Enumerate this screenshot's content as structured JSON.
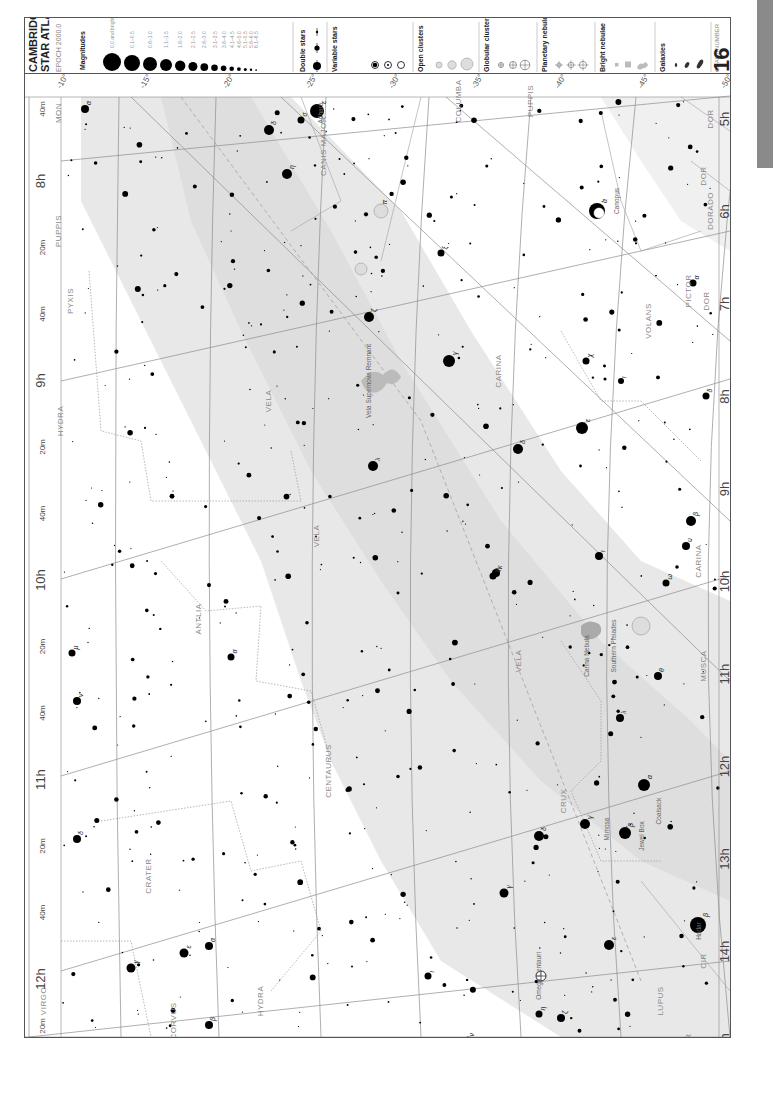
{
  "legend": {
    "title_line1": "CAMBRIDGE",
    "title_line2": "STAR ATLAS",
    "epoch": "EPOCH 2000.0",
    "magnitudes_label": "Magnitudes",
    "magnitudes": [
      {
        "label": "0.0 and brighter",
        "r": 9
      },
      {
        "label": "0.1–0.5",
        "r": 8
      },
      {
        "label": "0.6–1.0",
        "r": 7
      },
      {
        "label": "1.1–1.5",
        "r": 6
      },
      {
        "label": "1.6–2.0",
        "r": 5.2
      },
      {
        "label": "2.1–2.5",
        "r": 4.5
      },
      {
        "label": "2.6–3.0",
        "r": 3.9
      },
      {
        "label": "3.1–3.5",
        "r": 3.3
      },
      {
        "label": "3.6–4.0",
        "r": 2.8
      },
      {
        "label": "4.1–4.5",
        "r": 2.3
      },
      {
        "label": "4.6–5.0",
        "r": 1.9
      },
      {
        "label": "5.1–5.5",
        "r": 1.5
      },
      {
        "label": "5.6–6.0",
        "r": 1.2
      },
      {
        "label": "6.1–6.5",
        "r": 0.9
      }
    ],
    "double_stars_label": "Double stars",
    "variable_stars_label": "Variable stars",
    "variable_stars_sub": "max – min",
    "variable_stars": [
      "3.0–4.2",
      "3.0–5.5",
      "3.0–>6.5"
    ],
    "open_clusters_label": "Open clusters",
    "open_clusters": [
      "<10'",
      ">10'",
      "drawn to scale"
    ],
    "globular_clusters_label": "Globular clusters",
    "globular_clusters": [
      "<10'",
      "10'–30'",
      ">30'"
    ],
    "planetary_nebulae_label": "Planetary nebulae",
    "planetary_nebulae": [
      "<1'",
      "1'–10'",
      ">10'"
    ],
    "bright_nebulae_label": "Bright nebulae",
    "bright_nebulae": [
      "<10'",
      "10'–30'",
      ">30' drawn to scale"
    ],
    "galaxies_label": "Galaxies",
    "galaxies": [
      "<10'",
      "10'–30'",
      ">30' drawn to scale"
    ],
    "chart_number_label": "CHART NUMBER",
    "chart_number": "16"
  },
  "chart": {
    "ra_left": [
      "8h",
      "20m",
      "40m",
      "9h",
      "20m",
      "40m",
      "10h",
      "20m",
      "40m",
      "11h",
      "20m",
      "40m",
      "12h"
    ],
    "ra_left_top": "40m",
    "ra_left_bottom": "20m",
    "ra_right": [
      "5h",
      "6h",
      "7h",
      "8h",
      "9h",
      "10h",
      "11h",
      "12h",
      "13h",
      "14h",
      "15h"
    ],
    "dec_top": [
      "-10°",
      "-15°",
      "-20°",
      "-25°",
      "-30°",
      "-35°",
      "-40°",
      "-45°",
      "-50°"
    ],
    "dec_bottom": [
      "-10°",
      "-15°",
      "-20°",
      "-25°",
      "-30°",
      "-35°",
      "-40°",
      "-45°",
      "-50°"
    ],
    "dec_right": [
      "-60°",
      "-70°",
      "-70°",
      "-60°"
    ],
    "constellations": [
      {
        "name": "MON",
        "x": 60,
        "y": 112
      },
      {
        "name": "PUPPIS",
        "x": 60,
        "y": 230
      },
      {
        "name": "PYXIS",
        "x": 72,
        "y": 300
      },
      {
        "name": "HYDRA",
        "x": 62,
        "y": 420
      },
      {
        "name": "ANTLIA",
        "x": 200,
        "y": 618
      },
      {
        "name": "CANIS MAJOR",
        "x": 325,
        "y": 145
      },
      {
        "name": "COLUMBA",
        "x": 460,
        "y": 100
      },
      {
        "name": "PUPPIS",
        "x": 532,
        "y": 100
      },
      {
        "name": "VELA",
        "x": 270,
        "y": 400
      },
      {
        "name": "VELA",
        "x": 318,
        "y": 535
      },
      {
        "name": "VELA",
        "x": 520,
        "y": 660
      },
      {
        "name": "CARINA",
        "x": 500,
        "y": 370
      },
      {
        "name": "CARINA",
        "x": 700,
        "y": 560
      },
      {
        "name": "VOLANS",
        "x": 650,
        "y": 320
      },
      {
        "name": "PICTOR",
        "x": 690,
        "y": 290
      },
      {
        "name": "DORADO",
        "x": 712,
        "y": 210
      },
      {
        "name": "DOR",
        "x": 712,
        "y": 118
      },
      {
        "name": "DOR",
        "x": 705,
        "y": 175
      },
      {
        "name": "DOR",
        "x": 708,
        "y": 300
      },
      {
        "name": "MUSCA",
        "x": 705,
        "y": 665
      },
      {
        "name": "CRUX",
        "x": 565,
        "y": 800
      },
      {
        "name": "CENTAURUS",
        "x": 330,
        "y": 770
      },
      {
        "name": "CRATER",
        "x": 150,
        "y": 875
      },
      {
        "name": "CORVUS",
        "x": 175,
        "y": 1020
      },
      {
        "name": "HYDRA",
        "x": 262,
        "y": 1000
      },
      {
        "name": "VIRGO",
        "x": 45,
        "y": 1000
      },
      {
        "name": "LUPUS",
        "x": 662,
        "y": 1000
      },
      {
        "name": "CIR",
        "x": 705,
        "y": 960
      },
      {
        "name": "CIR",
        "x": 690,
        "y": 1040
      }
    ],
    "named_objects": [
      {
        "name": "Adhara",
        "x": 322,
        "y": 112
      },
      {
        "name": "Canopus",
        "x": 618,
        "y": 200
      },
      {
        "name": "Vela Supernova Remnant",
        "x": 370,
        "y": 380
      },
      {
        "name": "Southern Pleiades",
        "x": 615,
        "y": 645
      },
      {
        "name": "Carina Nebula",
        "x": 588,
        "y": 655
      },
      {
        "name": "Mimosa",
        "x": 608,
        "y": 828
      },
      {
        "name": "Jewel Box",
        "x": 643,
        "y": 835
      },
      {
        "name": "Coalsack",
        "x": 660,
        "y": 810
      },
      {
        "name": "Hadar",
        "x": 700,
        "y": 930
      },
      {
        "name": "Omega Centauri",
        "x": 540,
        "y": 975
      }
    ],
    "bright_stars": [
      {
        "x": 316,
        "y": 110,
        "r": 7,
        "label": "ε"
      },
      {
        "x": 286,
        "y": 173,
        "r": 5,
        "label": "η"
      },
      {
        "x": 268,
        "y": 129,
        "r": 5,
        "label": "δ"
      },
      {
        "x": 300,
        "y": 119,
        "r": 3.5,
        "label": "σ"
      },
      {
        "x": 596,
        "y": 210,
        "r": 8,
        "label": "α"
      },
      {
        "x": 368,
        "y": 316,
        "r": 5,
        "label": "ζ"
      },
      {
        "x": 448,
        "y": 360,
        "r": 6,
        "label": "γ"
      },
      {
        "x": 581,
        "y": 427,
        "r": 6,
        "label": "ε"
      },
      {
        "x": 517,
        "y": 448,
        "r": 5,
        "label": "δ"
      },
      {
        "x": 372,
        "y": 465,
        "r": 5,
        "label": "λ"
      },
      {
        "x": 495,
        "y": 572,
        "r": 4,
        "label": "κ"
      },
      {
        "x": 690,
        "y": 520,
        "r": 5,
        "label": "β"
      },
      {
        "x": 643,
        "y": 784,
        "r": 6,
        "label": "α"
      },
      {
        "x": 624,
        "y": 832,
        "r": 6,
        "label": "β"
      },
      {
        "x": 584,
        "y": 823,
        "r": 5,
        "label": "γ"
      },
      {
        "x": 697,
        "y": 924,
        "r": 8,
        "label": "β"
      },
      {
        "x": 538,
        "y": 835,
        "r": 5,
        "label": "δ"
      },
      {
        "x": 608,
        "y": 944,
        "r": 5,
        "label": "ε"
      },
      {
        "x": 560,
        "y": 1017,
        "r": 4,
        "label": "ζ"
      },
      {
        "x": 503,
        "y": 892,
        "r": 4.5,
        "label": "γ"
      },
      {
        "x": 183,
        "y": 952,
        "r": 4.5,
        "label": "ε"
      },
      {
        "x": 208,
        "y": 945,
        "r": 4,
        "label": "α"
      },
      {
        "x": 130,
        "y": 967,
        "r": 4.5,
        "label": "γ"
      },
      {
        "x": 208,
        "y": 1024,
        "r": 4,
        "label": "β"
      },
      {
        "x": 316,
        "y": 110,
        "r": 0,
        "label": ""
      },
      {
        "x": 84,
        "y": 108,
        "r": 4,
        "label": "α"
      },
      {
        "x": 442,
        "y": 1049,
        "r": 4,
        "label": "μ"
      },
      {
        "x": 467,
        "y": 1039,
        "r": 3.5,
        "label": "ν"
      },
      {
        "x": 619,
        "y": 717,
        "r": 4,
        "label": "λ"
      },
      {
        "x": 657,
        "y": 675,
        "r": 4,
        "label": "θ"
      },
      {
        "x": 538,
        "y": 1013,
        "r": 3.5,
        "label": "η"
      },
      {
        "x": 427,
        "y": 975,
        "r": 3.5,
        "label": "ι"
      },
      {
        "x": 76,
        "y": 838,
        "r": 4,
        "label": "δ"
      },
      {
        "x": 76,
        "y": 700,
        "r": 4,
        "label": "ν"
      },
      {
        "x": 71,
        "y": 652,
        "r": 3.5,
        "label": "μ"
      },
      {
        "x": 230,
        "y": 656,
        "r": 3.5,
        "label": "α"
      },
      {
        "x": 492,
        "y": 575,
        "r": 3.5,
        "label": "φ"
      },
      {
        "x": 440,
        "y": 252,
        "r": 3.5,
        "label": "ξ"
      },
      {
        "x": 380,
        "y": 207,
        "r": 3.5,
        "label": "π"
      },
      {
        "x": 685,
        "y": 545,
        "r": 4,
        "label": "υ"
      },
      {
        "x": 692,
        "y": 282,
        "r": 3.5,
        "label": "α"
      },
      {
        "x": 598,
        "y": 555,
        "r": 4,
        "label": "ι"
      },
      {
        "x": 665,
        "y": 582,
        "r": 3.5,
        "label": "ω"
      },
      {
        "x": 585,
        "y": 360,
        "r": 3.5,
        "label": "χ"
      },
      {
        "x": 620,
        "y": 380,
        "r": 3,
        "label": "ι"
      },
      {
        "x": 705,
        "y": 395,
        "r": 3.5,
        "label": "δ"
      }
    ],
    "shaded_color": "#e6e6e6",
    "grid_color": "#8c8c8c",
    "boundary_color": "#a0a0a0",
    "star_color": "#000000"
  }
}
